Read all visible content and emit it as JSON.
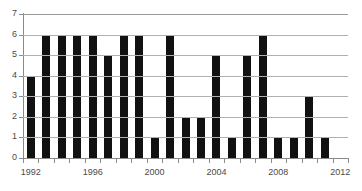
{
  "chart_data": {
    "type": "bar",
    "title": "",
    "subtitle": "",
    "xlabel": "",
    "ylabel": "",
    "categories": [
      "1992",
      "1993",
      "1994",
      "1995",
      "1996",
      "1997",
      "1998",
      "1999",
      "2000",
      "2001",
      "2002",
      "2003",
      "2004",
      "2005",
      "2006",
      "2007",
      "2008",
      "2009",
      "2010",
      "2011",
      "2012"
    ],
    "values": [
      4,
      6,
      6,
      6,
      6,
      5,
      6,
      6,
      1,
      6,
      2,
      2,
      5,
      1,
      5,
      6,
      1,
      1,
      3,
      1,
      0
    ],
    "ylim": [
      0,
      7
    ],
    "xlim_labels": [
      "1992",
      "1996",
      "2000",
      "2004",
      "2008",
      "2012"
    ],
    "y_ticks": [
      "0",
      "1",
      "2",
      "3",
      "4",
      "5",
      "6",
      "7"
    ],
    "x_tick_labels_shown": [
      "1992",
      "1996",
      "2000",
      "2004",
      "2008",
      "2012"
    ],
    "grid": true,
    "grid_orientation": "horizontal",
    "legend": null,
    "legend_position": "none",
    "bar_color": "#111111",
    "gridline_color": "#b0b0b0",
    "axis_color": "#8a8a8a",
    "label_color": "#4a4a4a",
    "background": "#ffffff",
    "annotations": []
  }
}
